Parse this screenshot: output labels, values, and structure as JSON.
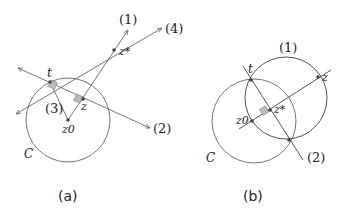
{
  "panel_a": {
    "caption": "(a)",
    "circle_label": "C",
    "labels": {
      "line1": "(1)",
      "line2": "(2)",
      "line3": "(3)",
      "line4": "(4)",
      "t": "t",
      "z": "z",
      "z_star": "z*",
      "z0": "z0"
    }
  },
  "panel_b": {
    "caption": "(b)",
    "circle_label": "C",
    "labels": {
      "circle1": "(1)",
      "line2": "(2)",
      "t": "t",
      "z": "z",
      "z_star": "z*",
      "z0": "z0"
    }
  },
  "colors": {
    "line": "#555555",
    "circle": "#777777",
    "right_angle_fill": "#bbbbbb"
  }
}
